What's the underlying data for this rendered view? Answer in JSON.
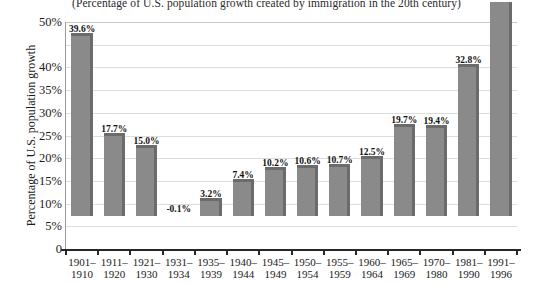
{
  "chart_data": {
    "type": "bar",
    "title": "(Percentage of U.S. population growth created by immigration in the 20th century)",
    "xlabel": "",
    "ylabel": "Percentage of U.S. population growth",
    "ylim": [
      0,
      50
    ],
    "grid": true,
    "legend": "none",
    "y_ticks": [
      "0",
      "5%",
      "10%",
      "15%",
      "20%",
      "25%",
      "30%",
      "35%",
      "40%",
      "50%"
    ],
    "y_tick_values": [
      0,
      5,
      10,
      15,
      20,
      25,
      30,
      35,
      40,
      50
    ],
    "categories": [
      "1901–\n1910",
      "1911–\n1920",
      "1921–\n1930",
      "1931–\n1934",
      "1935–\n1939",
      "1940–\n1944",
      "1945–\n1949",
      "1950–\n1954",
      "1955–\n1959",
      "1960–\n1964",
      "1965–\n1969",
      "1970–\n1980",
      "1981–\n1990",
      "1991–\n1996"
    ],
    "category_lines": [
      [
        "1901–",
        "1910"
      ],
      [
        "1911–",
        "1920"
      ],
      [
        "1921–",
        "1930"
      ],
      [
        "1931–",
        "1934"
      ],
      [
        "1935–",
        "1939"
      ],
      [
        "1940–",
        "1944"
      ],
      [
        "1945–",
        "1949"
      ],
      [
        "1950–",
        "1954"
      ],
      [
        "1955–",
        "1959"
      ],
      [
        "1960–",
        "1964"
      ],
      [
        "1965–",
        "1969"
      ],
      [
        "1970–",
        "1980"
      ],
      [
        "1981–",
        "1990"
      ],
      [
        "1991–",
        "1996"
      ]
    ],
    "values": [
      39.6,
      17.7,
      15.0,
      -0.1,
      3.2,
      7.4,
      10.2,
      10.6,
      10.7,
      12.5,
      19.7,
      19.4,
      32.8,
      47.1
    ],
    "value_labels": [
      "39.6%",
      "17.7%",
      "15.0%",
      "-0.1%",
      "3.2%",
      "7.4%",
      "10.2%",
      "10.6%",
      "10.7%",
      "12.5%",
      "19.7%",
      "19.4%",
      "32.8%",
      "47.1%"
    ],
    "colors": {
      "bar_fill": "#8a8a8a",
      "bar_shade": "#6b6b6b",
      "gridline": "#dcdcdc",
      "axis": "#262626",
      "background": "#ffffff",
      "text": "#1a1a1a"
    }
  }
}
